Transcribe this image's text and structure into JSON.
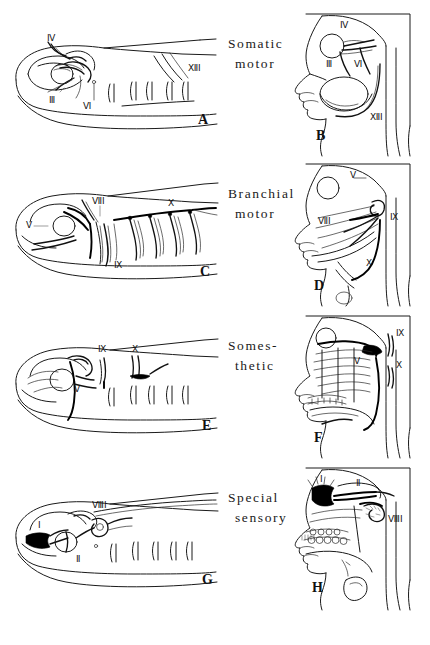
{
  "figure": {
    "title_visible": false,
    "rows": [
      {
        "id": "row-somatic-motor",
        "category": {
          "line1": "Somatic",
          "line2": "motor"
        },
        "fish": {
          "letter": "A",
          "nerve_labels": [
            "IV",
            "III",
            "VI",
            "XII"
          ]
        },
        "human": {
          "letter": "B",
          "nerve_labels": [
            "IV",
            "III",
            "VI",
            "XII"
          ]
        }
      },
      {
        "id": "row-branchial-motor",
        "category": {
          "line1": "Branchial",
          "line2": "motor"
        },
        "fish": {
          "letter": "C",
          "nerve_labels": [
            "V",
            "VII",
            "IX",
            "X"
          ]
        },
        "human": {
          "letter": "D",
          "nerve_labels": [
            "V",
            "VII",
            "IX",
            "X"
          ]
        }
      },
      {
        "id": "row-somesthetic",
        "category": {
          "line1": "Somes-",
          "line2": "thetic"
        },
        "fish": {
          "letter": "E",
          "nerve_labels": [
            "IX",
            "X",
            "V"
          ]
        },
        "human": {
          "letter": "F",
          "nerve_labels": [
            "IX",
            "X",
            "V"
          ]
        }
      },
      {
        "id": "row-special-sensory",
        "category": {
          "line1": "Special",
          "line2": "sensory"
        },
        "fish": {
          "letter": "G",
          "nerve_labels": [
            "I",
            "II",
            "VIII"
          ]
        },
        "human": {
          "letter": "H",
          "nerve_labels": [
            "I",
            "II",
            "VIII"
          ]
        }
      }
    ]
  },
  "colors": {
    "ink": "#1a1a1a",
    "paper": "#ffffff",
    "heavy_ink": "#000000"
  }
}
